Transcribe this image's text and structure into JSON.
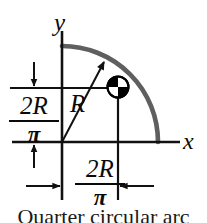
{
  "figure": {
    "caption": "Quarter circular arc",
    "axes": {
      "x_label": "x",
      "y_label": "y"
    },
    "radius_label": "R",
    "dimensions": {
      "vertical": {
        "numerator": "2R",
        "denominator": "π"
      },
      "horizontal": {
        "numerator": "2R",
        "denominator": "π"
      }
    },
    "colors": {
      "arc": "#5f5f5f",
      "line": "#111111",
      "centroid_fill": "#000000",
      "background": "#ffffff"
    },
    "geometry": {
      "origin_x": 62,
      "origin_y": 142,
      "arc_radius": 96,
      "centroid_x": 118,
      "centroid_y": 87
    }
  }
}
